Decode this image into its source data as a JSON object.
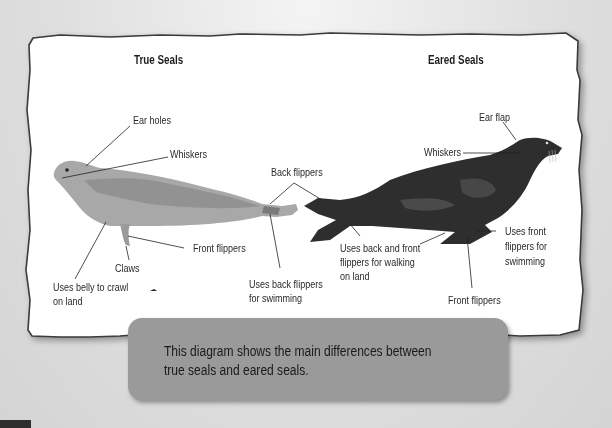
{
  "diagram": {
    "colors": {
      "paper": "#ffffff",
      "paper_border": "#3a3a3a",
      "background": "#d9d9d9",
      "true_seal_body": "#a8a8a8",
      "true_seal_patches": "#8a8a8a",
      "eared_seal_body": "#2c2c2c",
      "eared_seal_patches": "#4a4a4a",
      "caption_box": "#9a9a9a",
      "leader_lines": "#222222"
    },
    "sections": [
      {
        "title": "True Seals",
        "labels": [
          "Ear holes",
          "Whiskers",
          "Front flippers",
          "Claws",
          "Uses belly to crawl on land",
          "Uses back flippers for swimming"
        ]
      },
      {
        "title": "Eared Seals",
        "labels": [
          "Ear flap",
          "Whiskers",
          "Uses back and front flippers for walking on land",
          "Uses front flippers for swimming",
          "Front flippers"
        ]
      }
    ],
    "shared_labels": [
      "Back flippers"
    ]
  },
  "text": {
    "true_title": "True Seals",
    "eared_title": "Eared Seals",
    "true_ear": "Ear holes",
    "true_whiskers": "Whiskers",
    "back_flippers": "Back flippers",
    "true_front": "Front flippers",
    "true_claws": "Claws",
    "true_belly_1": "Uses belly to crawl",
    "true_belly_2": "on land",
    "true_swim_1": "Uses back flippers",
    "true_swim_2": "for swimming",
    "eared_ear": "Ear flap",
    "eared_whiskers": "Whiskers",
    "eared_walk_1": "Uses back and front",
    "eared_walk_2": "flippers for walking",
    "eared_walk_3": "on land",
    "eared_swim_1": "Uses front",
    "eared_swim_2": "flippers for",
    "eared_swim_3": "swimming",
    "eared_front": "Front flippers"
  },
  "caption": {
    "line1": "This diagram shows the main differences between",
    "line2": "true seals and eared seals."
  }
}
